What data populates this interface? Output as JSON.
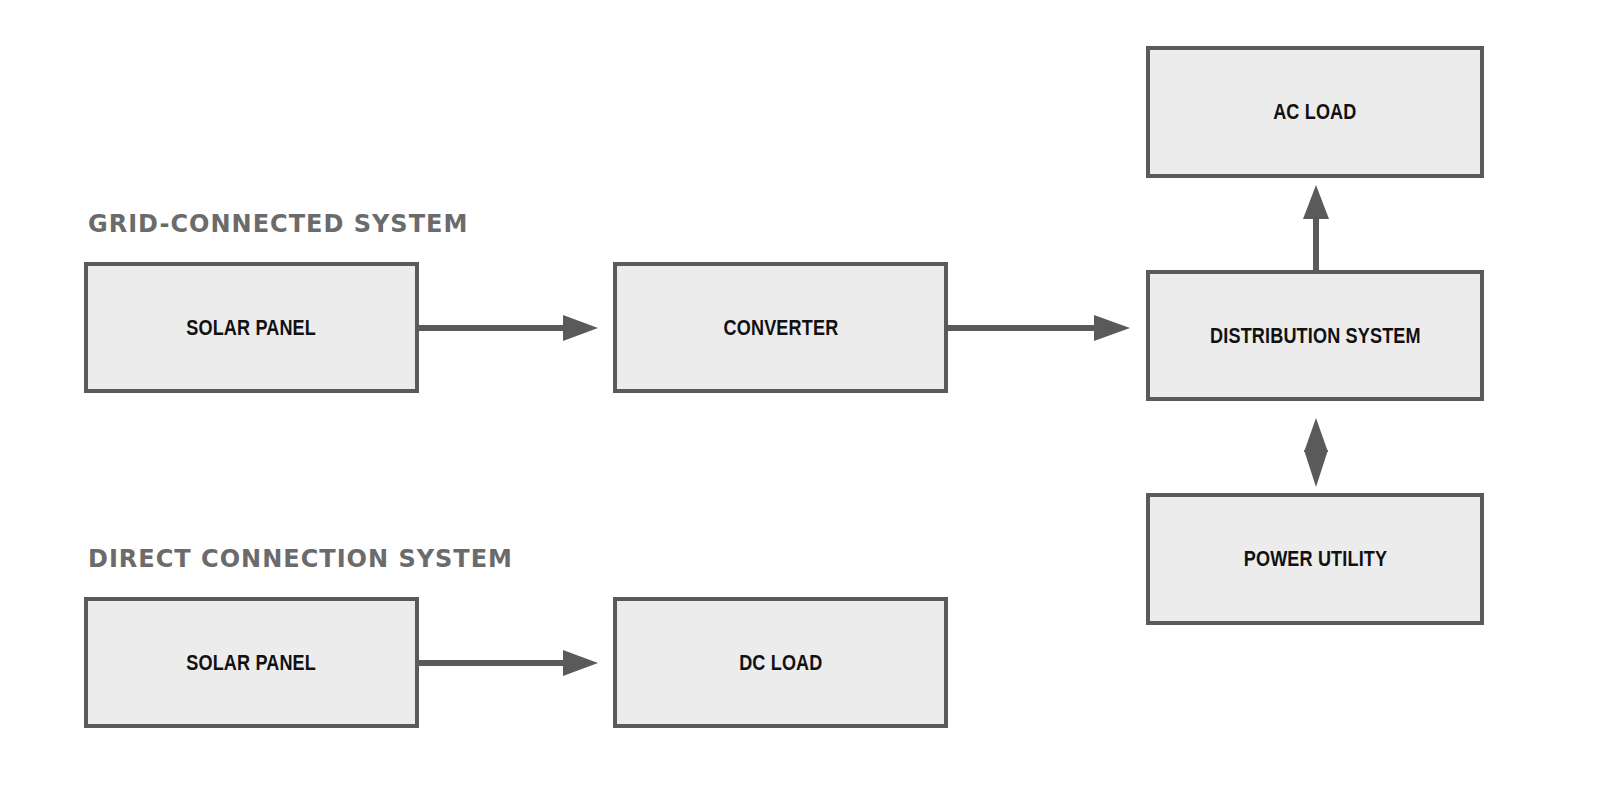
{
  "diagram": {
    "sections": [
      {
        "title": "GRID-CONNECTED SYSTEM"
      },
      {
        "title": "DIRECT CONNECTION SYSTEM"
      }
    ],
    "nodes": {
      "grid_solar_panel": "SOLAR PANEL",
      "converter": "CONVERTER",
      "distribution_system": "DISTRIBUTION SYSTEM",
      "ac_load": "AC LOAD",
      "power_utility": "POWER UTILITY",
      "direct_solar_panel": "SOLAR PANEL",
      "dc_load": "DC LOAD"
    },
    "edges": [
      {
        "from": "SOLAR PANEL",
        "to": "CONVERTER",
        "type": "one-way"
      },
      {
        "from": "CONVERTER",
        "to": "DISTRIBUTION SYSTEM",
        "type": "one-way"
      },
      {
        "from": "DISTRIBUTION SYSTEM",
        "to": "AC LOAD",
        "type": "one-way"
      },
      {
        "from": "DISTRIBUTION SYSTEM",
        "to": "POWER UTILITY",
        "type": "two-way"
      },
      {
        "from": "SOLAR PANEL",
        "to": "DC LOAD",
        "type": "one-way"
      }
    ],
    "colors": {
      "box_fill": "#ececec",
      "box_border": "#5a5a5a",
      "arrow": "#5a5a5a",
      "heading": "#6b6b6b",
      "label": "#111111"
    }
  }
}
